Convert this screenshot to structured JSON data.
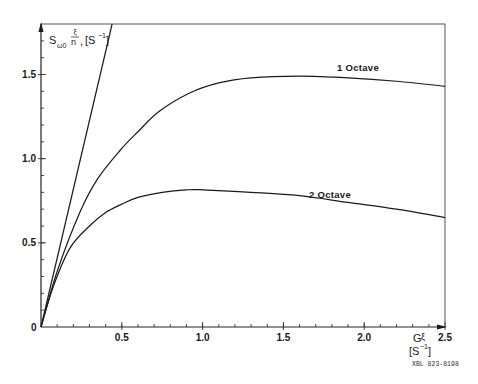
{
  "chart_data": {
    "type": "line",
    "title": "",
    "ylabel": "S_{ω0} ξ/n, [S^-1]",
    "ylabel_parts": {
      "main": "S",
      "sub": "ω0",
      "frac_num": "ξ",
      "frac_den": "n",
      "unit": "[S",
      "unit_exp": "−1",
      "unit_close": "]"
    },
    "xlabel": "Gξ [S^-1]",
    "xlabel_parts": {
      "main": "G",
      "sym": "ξ",
      "unit": "[S",
      "unit_exp": "−1",
      "unit_close": "]"
    },
    "xlim": [
      0,
      2.5
    ],
    "ylim": [
      0,
      1.8
    ],
    "x_ticks": [
      "0.5",
      "1.0",
      "1.5",
      "2.0",
      "2.5"
    ],
    "y_ticks": [
      "0.5",
      "1.0",
      "1.5"
    ],
    "origin_label": "0",
    "grid": false,
    "legend": "inline labels",
    "series": [
      {
        "name": "Linear (limit)",
        "label": "",
        "x": [
          0,
          0.44
        ],
        "y": [
          0,
          1.8
        ]
      },
      {
        "name": "1 Octave",
        "label": "1 Octave",
        "x": [
          0,
          0.1,
          0.24,
          0.35,
          0.49,
          0.6,
          0.73,
          0.92,
          1.1,
          1.3,
          1.6,
          1.9,
          2.2,
          2.5
        ],
        "y": [
          0,
          0.33,
          0.68,
          0.88,
          1.05,
          1.16,
          1.28,
          1.39,
          1.45,
          1.48,
          1.49,
          1.48,
          1.46,
          1.43
        ]
      },
      {
        "name": "2 Octave",
        "label": "2 Octave",
        "x": [
          0,
          0.08,
          0.18,
          0.3,
          0.4,
          0.5,
          0.6,
          0.75,
          0.9,
          1.0,
          1.3,
          1.6,
          1.9,
          2.2,
          2.5
        ],
        "y": [
          0,
          0.25,
          0.47,
          0.6,
          0.68,
          0.73,
          0.77,
          0.8,
          0.815,
          0.815,
          0.8,
          0.78,
          0.74,
          0.7,
          0.65
        ]
      }
    ],
    "annotations": [
      "1 Octave",
      "2 Octave"
    ],
    "figure_id": "XBL 823-8198"
  }
}
